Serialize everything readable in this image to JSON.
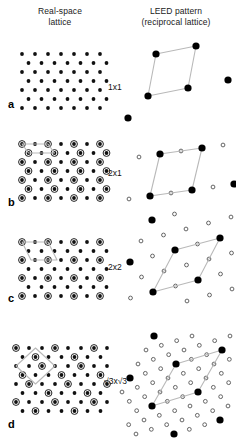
{
  "figure": {
    "width": 236,
    "height": 441,
    "background": "#ffffff",
    "headers": {
      "left_line1": "Real-space",
      "left_line2": "lattice",
      "right_line1": "LEED pattern",
      "right_line2": "(reciprocal lattice)"
    },
    "colors": {
      "substrate_dot": "#111111",
      "adsorbate_ring": "#222222",
      "leed_integer_spot": "#000000",
      "leed_fractional_spot_stroke": "#555555",
      "unit_cell_line": "#b9b9b9",
      "text": "#111111"
    },
    "panel_letters": [
      "a",
      "b",
      "c",
      "d"
    ],
    "order_labels": [
      "1x1",
      "2x1",
      "2x2",
      "√3x√3"
    ],
    "rows": [
      {
        "letter": "a",
        "order_label": "1x1",
        "description": "unreconstructed hexagonal substrate lattice, no superlattice atoms",
        "real_space": {
          "lattice": "hexagonal",
          "a_px": 13.0,
          "row_dy_px": 9.0,
          "substrate_dot_radius_px": 1.9,
          "adsorbate_period_x": 0,
          "adsorbate_period_y": 0,
          "unit_cell": "none"
        },
        "leed": {
          "integer_spot_radius_px": 3.6,
          "fractional_spot_radius_px": 0,
          "fractional_order": 0,
          "unit_cell_drawn": true,
          "unit_cell_vertices": [
            [
              0,
              0
            ],
            [
              1,
              0
            ],
            [
              1,
              1
            ],
            [
              0,
              1
            ]
          ]
        }
      },
      {
        "letter": "b",
        "order_label": "2x1",
        "description": "2x1 superlattice: adsorbate atoms on every second column, every row",
        "real_space": {
          "lattice": "hexagonal",
          "a_px": 13.0,
          "row_dy_px": 9.0,
          "substrate_dot_radius_px": 1.9,
          "adsorbate_period_x": 2,
          "adsorbate_period_y": 1,
          "adsorbate_ring_radius_px": 3.4,
          "unit_cell": "rectangle-2x1"
        },
        "leed": {
          "integer_spot_radius_px": 3.6,
          "fractional_spot_radius_px": 1.9,
          "fractional_order": 2,
          "fractional_axis": "one-direction",
          "unit_cell_drawn": true
        }
      },
      {
        "letter": "c",
        "order_label": "2x2",
        "description": "2x2 superlattice: adsorbate atoms on every second column and every second row",
        "real_space": {
          "lattice": "hexagonal",
          "a_px": 13.0,
          "row_dy_px": 9.0,
          "substrate_dot_radius_px": 1.9,
          "adsorbate_period_x": 2,
          "adsorbate_period_y": 2,
          "adsorbate_ring_radius_px": 3.4,
          "unit_cell": "rhombus-2x2"
        },
        "leed": {
          "integer_spot_radius_px": 3.6,
          "fractional_spot_radius_px": 1.9,
          "fractional_order": 2,
          "fractional_axis": "both-directions",
          "unit_cell_drawn": true
        }
      },
      {
        "letter": "d",
        "order_label": "√3x√3",
        "description": "root3 x root3 R30 superlattice: adsorbate atoms on one third of sites, rotated cell",
        "real_space": {
          "lattice": "hexagonal",
          "a_px": 13.0,
          "row_dy_px": 9.0,
          "substrate_dot_radius_px": 1.9,
          "adsorbate_fraction": "1/3",
          "adsorbate_ring_radius_px": 3.4,
          "unit_cell": "rhombus-root3-rotated"
        },
        "leed": {
          "integer_spot_radius_px": 3.6,
          "fractional_spot_radius_px": 1.9,
          "fractional_order": 3,
          "fractional_axis": "both-directions",
          "unit_cell_drawn": true
        }
      }
    ]
  }
}
